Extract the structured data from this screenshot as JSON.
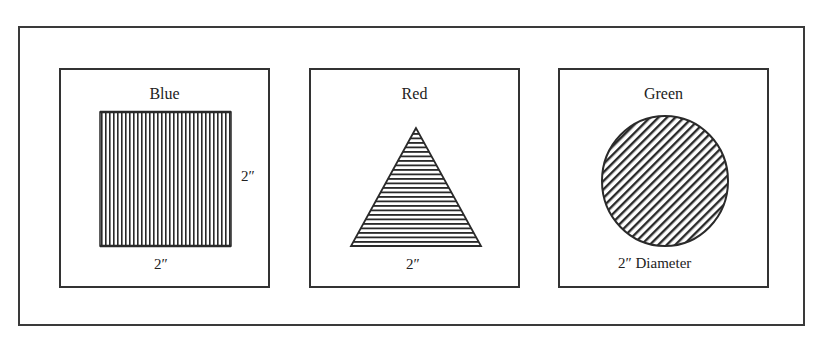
{
  "figure": {
    "panels": [
      {
        "title": "Blue",
        "shape": "square",
        "fill_pattern": "vertical-lines",
        "bottom_label": "2″",
        "side_label": "2″"
      },
      {
        "title": "Red",
        "shape": "triangle",
        "fill_pattern": "horizontal-lines",
        "bottom_label": "2″"
      },
      {
        "title": "Green",
        "shape": "circle",
        "fill_pattern": "diagonal-lines",
        "bottom_label": "2″ Diameter"
      }
    ],
    "colors": {
      "ink": "#2a2a2a",
      "background": "#ffffff"
    }
  }
}
